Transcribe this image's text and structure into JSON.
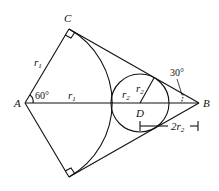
{
  "diagram": {
    "points": {
      "A": {
        "label": "A",
        "x": 25,
        "y": 103
      },
      "B": {
        "label": "B",
        "x": 199,
        "y": 103
      },
      "C": {
        "label": "C",
        "x": 69,
        "y": 29
      },
      "E": {
        "label": "",
        "x": 69,
        "y": 177
      },
      "D": {
        "label": "D",
        "x": 140,
        "y": 103
      }
    },
    "labels": {
      "A": "A",
      "B": "B",
      "C": "C",
      "D": "D",
      "r1_side": "r",
      "r1_side_sub": "1",
      "r1_axis": "r",
      "r1_axis_sub": "1",
      "r2_a": "r",
      "r2_a_sub": "2",
      "r2_b": "r",
      "r2_b_sub": "2",
      "dist": "2r",
      "dist_sub": "2",
      "angle_A": "60°",
      "angle_B": "30°"
    },
    "circle_radius": 29,
    "arc_radius": 85
  }
}
